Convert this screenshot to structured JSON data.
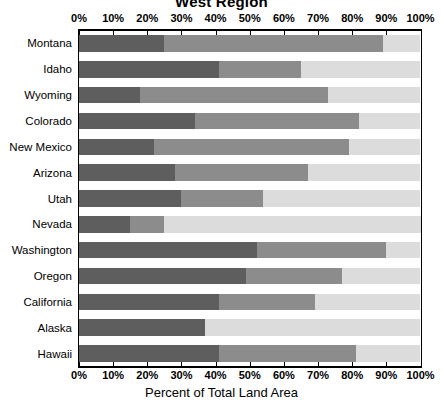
{
  "chart_data": {
    "type": "bar",
    "orientation": "horizontal",
    "stacked": true,
    "title": "West Region",
    "xlabel": "Percent of Total Land Area",
    "ylabel": "",
    "xlim": [
      0,
      100
    ],
    "grid": false,
    "legend": null,
    "xticks": [
      "0%",
      "10%",
      "20%",
      "30%",
      "40%",
      "50%",
      "60%",
      "70%",
      "80%",
      "90%",
      "100%"
    ],
    "xtick_values": [
      0,
      10,
      20,
      30,
      40,
      50,
      60,
      70,
      80,
      90,
      100
    ],
    "categories": [
      "Montana",
      "Idaho",
      "Wyoming",
      "Colorado",
      "New Mexico",
      "Arizona",
      "Utah",
      "Nevada",
      "Washington",
      "Oregon",
      "California",
      "Alaska",
      "Hawaii"
    ],
    "series": [
      {
        "name": "segment-1-dark",
        "color": "#5e5e5e",
        "values": [
          25,
          41,
          18,
          34,
          22,
          28,
          30,
          15,
          52,
          49,
          41,
          37,
          41
        ]
      },
      {
        "name": "segment-2-medium",
        "color": "#8c8c8c",
        "values": [
          64,
          24,
          55,
          48,
          57,
          39,
          24,
          10,
          38,
          28,
          28,
          0,
          40
        ]
      },
      {
        "name": "segment-3-light",
        "color": "#dcdcdc",
        "values": [
          11,
          35,
          27,
          18,
          21,
          33,
          46,
          75,
          10,
          23,
          31,
          63,
          19
        ]
      }
    ],
    "cumulative_boundaries": [
      {
        "category": "Montana",
        "b1": 25,
        "b2": 89
      },
      {
        "category": "Idaho",
        "b1": 41,
        "b2": 65
      },
      {
        "category": "Wyoming",
        "b1": 18,
        "b2": 73
      },
      {
        "category": "Colorado",
        "b1": 34,
        "b2": 82
      },
      {
        "category": "New Mexico",
        "b1": 22,
        "b2": 79
      },
      {
        "category": "Arizona",
        "b1": 28,
        "b2": 67
      },
      {
        "category": "Utah",
        "b1": 30,
        "b2": 54
      },
      {
        "category": "Nevada",
        "b1": 15,
        "b2": 25
      },
      {
        "category": "Washington",
        "b1": 52,
        "b2": 90
      },
      {
        "category": "Oregon",
        "b1": 49,
        "b2": 77
      },
      {
        "category": "California",
        "b1": 41,
        "b2": 69
      },
      {
        "category": "Alaska",
        "b1": 37,
        "b2": 37
      },
      {
        "category": "Hawaii",
        "b1": 41,
        "b2": 81
      }
    ]
  },
  "colors": {
    "dark": "#5e5e5e",
    "medium": "#8c8c8c",
    "light": "#dcdcdc",
    "axis": "#000000",
    "background": "#ffffff"
  }
}
